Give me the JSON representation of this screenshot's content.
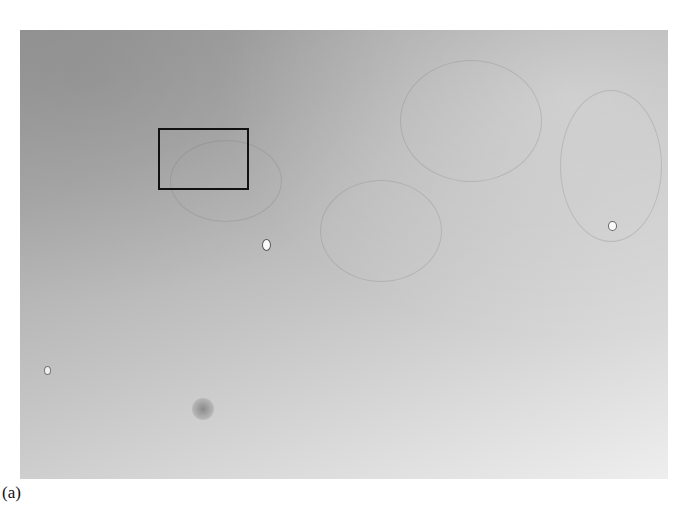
{
  "figure": {
    "panel_label": "(a)",
    "image": {
      "description": "grayscale phase-contrast microscopy field of cells",
      "x": 20,
      "y": 30,
      "width": 648,
      "height": 449
    },
    "roi": {
      "x": 158,
      "y": 128,
      "width": 91,
      "height": 62,
      "color": "#111111"
    },
    "features": [
      {
        "name": "bright-particle",
        "x": 265,
        "y": 244
      },
      {
        "name": "bright-particle",
        "x": 611,
        "y": 226
      },
      {
        "name": "dark-spot",
        "x": 202,
        "y": 409
      }
    ]
  }
}
